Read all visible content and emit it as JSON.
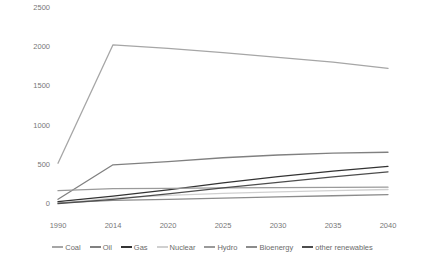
{
  "chart_data": {
    "type": "line",
    "title": "",
    "xlabel": "",
    "ylabel": "",
    "x": [
      1990,
      2014,
      2020,
      2025,
      2030,
      2035,
      2040
    ],
    "categories": [
      "1990",
      "2014",
      "2020",
      "2025",
      "2030",
      "2035",
      "2040"
    ],
    "xlim": [
      1990,
      2040
    ],
    "ylim": [
      0,
      2500
    ],
    "yticks": [
      0,
      500,
      1000,
      1500,
      2000,
      2500
    ],
    "ytick_labels": [
      "0",
      "500",
      "1000",
      "1500",
      "2000",
      "2500"
    ],
    "grid": false,
    "legend_position": "bottom",
    "series": [
      {
        "name": "Coal",
        "color": "#a6a6a6",
        "values": [
          520,
          2030,
          1985,
          1930,
          1870,
          1810,
          1730
        ]
      },
      {
        "name": "Oil",
        "color": "#808080",
        "values": [
          60,
          500,
          540,
          590,
          625,
          650,
          660
        ]
      },
      {
        "name": "Gas",
        "color": "#333333",
        "values": [
          30,
          100,
          180,
          270,
          350,
          420,
          480
        ]
      },
      {
        "name": "Nuclear",
        "color": "#d0d0d0",
        "values": [
          10,
          75,
          110,
          135,
          155,
          170,
          185
        ]
      },
      {
        "name": "Hydro",
        "color": "#9a9a9a",
        "values": [
          170,
          195,
          200,
          205,
          208,
          212,
          215
        ]
      },
      {
        "name": "Bioenergy",
        "color": "#8c8c8c",
        "values": [
          15,
          45,
          60,
          75,
          90,
          105,
          120
        ]
      },
      {
        "name": "other renewables",
        "color": "#4d4d4d",
        "values": [
          5,
          60,
          130,
          205,
          275,
          345,
          410
        ]
      }
    ]
  },
  "legend": {
    "items": [
      {
        "label": "Coal"
      },
      {
        "label": "Oil"
      },
      {
        "label": "Gas"
      },
      {
        "label": "Nuclear"
      },
      {
        "label": "Hydro"
      },
      {
        "label": "Bioenergy"
      },
      {
        "label": "other renewables"
      }
    ]
  }
}
